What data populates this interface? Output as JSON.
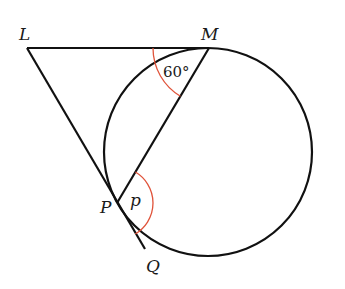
{
  "figure": {
    "points": {
      "L": {
        "label": "L",
        "x": 27,
        "y": 48
      },
      "M": {
        "label": "M",
        "x": 209,
        "y": 48
      },
      "P": {
        "label": "P",
        "x": 117,
        "y": 203
      },
      "Q": {
        "label": "Q",
        "x": 145,
        "y": 249
      }
    },
    "circle": {
      "cx": 208,
      "cy": 152,
      "r": 104
    },
    "angles": {
      "at_M": {
        "label": "60°",
        "color": "#e0533a"
      },
      "at_P": {
        "label": "p",
        "color": "#e0533a"
      }
    },
    "colors": {
      "stroke": "#111111",
      "arc": "#e0533a"
    }
  }
}
